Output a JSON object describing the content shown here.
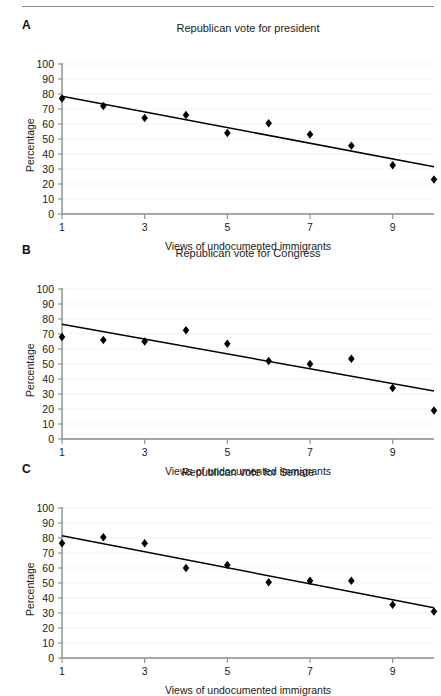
{
  "figure": {
    "width": 441,
    "height": 695,
    "background": "#ffffff",
    "rule_color": "#8d8d8d",
    "marker_color": "#000000",
    "line_color": "#000000",
    "grid_color": "#d9d9d9",
    "axis_color": "#8a8a8a"
  },
  "panels": [
    {
      "letter": "A",
      "title": "Republican vote for president",
      "xlabel": "Views of undocumented immigrants",
      "ylabel": "Percentage"
    },
    {
      "letter": "B",
      "title": "Republican vote for Congress",
      "xlabel": "Views of undocumented immigrants",
      "ylabel": "Percentage"
    },
    {
      "letter": "C",
      "title": "Republican vote for Senate",
      "xlabel": "Views of undocumented immigrants",
      "ylabel": "Percentage"
    }
  ],
  "chart_data": [
    {
      "type": "scatter",
      "title": "Republican vote for president",
      "panel": "A",
      "xlabel": "Views of undocumented immigrants",
      "ylabel": "Percentage",
      "xlim": [
        1,
        10
      ],
      "ylim": [
        0,
        100
      ],
      "yticks": [
        0,
        10,
        20,
        30,
        40,
        50,
        60,
        70,
        80,
        90,
        100
      ],
      "xticks": [
        1,
        3,
        5,
        7,
        9
      ],
      "xtick_labels": [
        "1",
        "3",
        "5",
        "7",
        "9"
      ],
      "grid": "horizontal-dotted",
      "legend": "none",
      "x": [
        1,
        2,
        3,
        4,
        5,
        6,
        7,
        8,
        9,
        10
      ],
      "values": [
        77,
        72,
        64,
        66,
        54,
        60.5,
        53,
        45.5,
        32.5,
        23
      ],
      "trendline": {
        "x0": 1,
        "y0": 78.5,
        "x1": 10,
        "y1": 31.5
      }
    },
    {
      "type": "scatter",
      "title": "Republican vote for Congress",
      "panel": "B",
      "xlabel": "Views of undocumented immigrants",
      "ylabel": "Percentage",
      "xlim": [
        1,
        10
      ],
      "ylim": [
        0,
        100
      ],
      "yticks": [
        0,
        10,
        20,
        30,
        40,
        50,
        60,
        70,
        80,
        90,
        100
      ],
      "xticks": [
        1,
        3,
        5,
        7,
        9
      ],
      "xtick_labels": [
        "1",
        "3",
        "5",
        "7",
        "9"
      ],
      "grid": "horizontal-dotted",
      "legend": "none",
      "x": [
        1,
        2,
        3,
        4,
        5,
        6,
        7,
        8,
        9,
        10
      ],
      "values": [
        68,
        66,
        65,
        72.5,
        63.5,
        52,
        50,
        53.5,
        34,
        19
      ],
      "trendline": {
        "x0": 1,
        "y0": 76.5,
        "x1": 10,
        "y1": 32
      }
    },
    {
      "type": "scatter",
      "title": "Republican vote for Senate",
      "panel": "C",
      "xlabel": "Views of undocumented immigrants",
      "ylabel": "Percentage",
      "xlim": [
        1,
        10
      ],
      "ylim": [
        0,
        100
      ],
      "yticks": [
        0,
        10,
        20,
        30,
        40,
        50,
        60,
        70,
        80,
        90,
        100
      ],
      "xticks": [
        1,
        3,
        5,
        7,
        9
      ],
      "xtick_labels": [
        "1",
        "3",
        "5",
        "7",
        "9"
      ],
      "grid": "horizontal-dotted",
      "legend": "none",
      "x": [
        1,
        2,
        3,
        4,
        5,
        6,
        7,
        8,
        9,
        10
      ],
      "values": [
        76.5,
        80.5,
        76.5,
        60,
        62,
        50.5,
        51.5,
        51.5,
        35.5,
        31
      ],
      "trendline": {
        "x0": 1,
        "y0": 81.5,
        "x1": 10,
        "y1": 33.5
      }
    }
  ]
}
